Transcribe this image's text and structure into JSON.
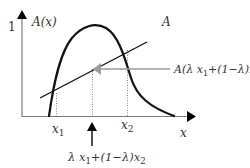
{
  "diagram": {
    "y_axis": {
      "tick_label": "1",
      "label": "A(x)"
    },
    "x_axis": {
      "label": "x"
    },
    "curve_label": "A",
    "points": {
      "x1": {
        "base": "x",
        "sub": "1"
      },
      "x2": {
        "base": "x",
        "sub": "2"
      }
    },
    "combination_label": {
      "part1": "λ x",
      "sub1": "1",
      "part2": "+(1−λ)x",
      "sub2": "2"
    },
    "value_label": {
      "part1": "A(λ x",
      "sub1": "1",
      "part2": "+(1−λ)x",
      "sub2": "2",
      "part3": ")"
    },
    "colors": {
      "curve": "#111111",
      "axis": "#666666",
      "pointer": "#999999",
      "dotted": "#888888"
    }
  }
}
